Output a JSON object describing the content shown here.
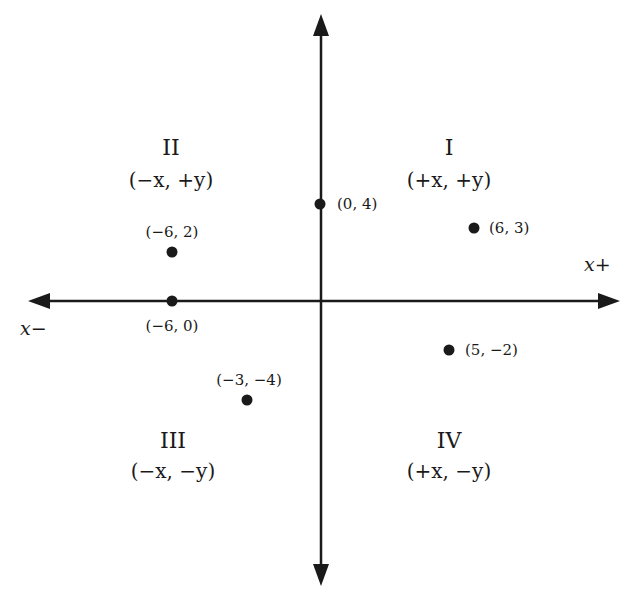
{
  "diagram": {
    "axes": {
      "x_positive_label": "x+",
      "x_negative_label": "x−"
    },
    "quadrants": [
      {
        "numeral": "I",
        "signs": "(+x, +y)"
      },
      {
        "numeral": "II",
        "signs": "(−x, +y)"
      },
      {
        "numeral": "III",
        "signs": "(−x, −y)"
      },
      {
        "numeral": "IV",
        "signs": "(+x, −y)"
      }
    ],
    "points": [
      {
        "x": 0,
        "y": 4,
        "label": "(0, 4)"
      },
      {
        "x": 6,
        "y": 3,
        "label": "(6, 3)"
      },
      {
        "x": -6,
        "y": 2,
        "label": "(−6, 2)"
      },
      {
        "x": -6,
        "y": 0,
        "label": "(−6, 0)"
      },
      {
        "x": 5,
        "y": -2,
        "label": "(5, −2)"
      },
      {
        "x": -3,
        "y": -4,
        "label": "(−3, −4)"
      }
    ],
    "colors": {
      "ink": "#1a1a1a",
      "background": "#ffffff"
    }
  }
}
